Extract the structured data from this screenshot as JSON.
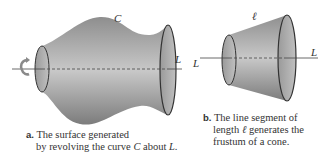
{
  "figure_a": {
    "curve_label": "C",
    "axis_label": "L",
    "caption_tag": "a.",
    "caption_line1": "The surface generated",
    "caption_line2_prefix": "by revolving the curve ",
    "caption_line2_var1": "C",
    "caption_line2_mid": " about ",
    "caption_line2_var2": "L",
    "caption_line2_end": "."
  },
  "figure_b": {
    "segment_label": "ℓ",
    "axis_label_left": "L",
    "axis_label_right": "L",
    "caption_tag": "b.",
    "caption_line1": "The line segment of",
    "caption_line2_prefix": "length ",
    "caption_line2_var": "ℓ",
    "caption_line2_suffix": " generates the",
    "caption_line3": "frustum of a cone."
  },
  "colors": {
    "surface_light": "#c4c4c4",
    "surface_dark": "#7a7a7a",
    "outline": "#333333",
    "rotation_arrow": "#8a8a8a"
  }
}
